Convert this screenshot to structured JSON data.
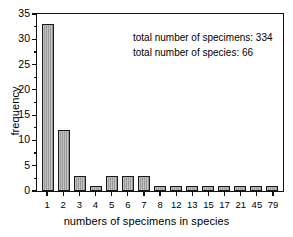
{
  "chart_data": {
    "type": "bar",
    "title": "",
    "xlabel": "numbers of specimens in species",
    "ylabel": "frequency",
    "categories": [
      "1",
      "2",
      "3",
      "4",
      "5",
      "6",
      "7",
      "8",
      "12",
      "13",
      "15",
      "17",
      "21",
      "45",
      "79"
    ],
    "values": [
      33,
      12,
      3,
      1,
      3,
      3,
      3,
      1,
      1,
      1,
      1,
      1,
      1,
      1,
      1
    ],
    "ylim": [
      0,
      35
    ],
    "ytick_labels": [
      "0",
      "5",
      "10",
      "15",
      "20",
      "25",
      "30",
      "35"
    ],
    "ytick_values": [
      0,
      5,
      10,
      15,
      20,
      25,
      30,
      35
    ],
    "yminor_values": [
      2.5,
      7.5,
      12.5,
      17.5,
      22.5,
      27.5,
      32.5
    ],
    "grid": false,
    "legend": "none",
    "bar_fill_color": "#a6a6a6",
    "bar_edge_color": "#1a1a1a",
    "annotations": [
      "total number of specimens: 334",
      "total number of species: 66"
    ]
  }
}
